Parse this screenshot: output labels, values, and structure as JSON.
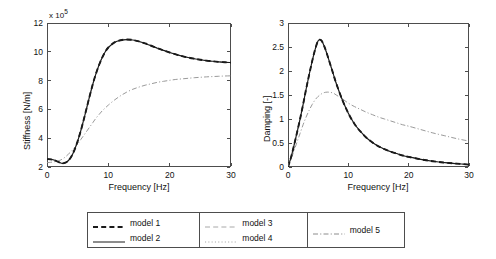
{
  "chart_data": [
    {
      "type": "line",
      "title": "",
      "xlabel": "Frequency [Hz]",
      "ylabel": "Stiffness [N/m]",
      "y_exponent_label": "x 10",
      "y_exponent_value": "5",
      "xlim": [
        0,
        30
      ],
      "ylim": [
        2,
        12
      ],
      "xticks": [
        "0",
        "10",
        "20",
        "30"
      ],
      "yticks": [
        "2",
        "4",
        "6",
        "8",
        "10",
        "12"
      ],
      "grid": false,
      "x": [
        0,
        1,
        2,
        2.5,
        3,
        3.5,
        4,
        4.5,
        5,
        5.5,
        6,
        6.5,
        7,
        7.5,
        8,
        8.5,
        9,
        9.5,
        10,
        11,
        12,
        13,
        14,
        15,
        16,
        17,
        18,
        19,
        20,
        21,
        22,
        23,
        24,
        25,
        26,
        27,
        28,
        29,
        30
      ],
      "series": [
        {
          "name": "model 1",
          "style": "dashed",
          "color": "#1a1a1a",
          "values": [
            2.55,
            2.5,
            2.32,
            2.25,
            2.3,
            2.45,
            2.75,
            3.2,
            3.8,
            4.5,
            5.3,
            6.15,
            7.0,
            7.8,
            8.5,
            9.1,
            9.6,
            10.0,
            10.3,
            10.65,
            10.8,
            10.85,
            10.82,
            10.72,
            10.58,
            10.42,
            10.25,
            10.1,
            9.95,
            9.82,
            9.7,
            9.6,
            9.52,
            9.45,
            9.39,
            9.34,
            9.3,
            9.27,
            9.25
          ]
        },
        {
          "name": "model 2",
          "style": "solid",
          "color": "#1a1a1a",
          "values": [
            2.55,
            2.5,
            2.32,
            2.25,
            2.3,
            2.45,
            2.75,
            3.2,
            3.8,
            4.5,
            5.3,
            6.15,
            7.0,
            7.8,
            8.5,
            9.1,
            9.6,
            10.0,
            10.3,
            10.65,
            10.8,
            10.85,
            10.82,
            10.72,
            10.58,
            10.42,
            10.25,
            10.1,
            9.95,
            9.82,
            9.7,
            9.6,
            9.52,
            9.45,
            9.39,
            9.34,
            9.3,
            9.27,
            9.25
          ]
        },
        {
          "name": "model 3",
          "style": "dashed",
          "color": "#9a9a9a",
          "values": [
            2.55,
            2.5,
            2.32,
            2.25,
            2.3,
            2.45,
            2.75,
            3.2,
            3.8,
            4.5,
            5.3,
            6.15,
            7.0,
            7.8,
            8.5,
            9.1,
            9.6,
            10.0,
            10.3,
            10.65,
            10.8,
            10.85,
            10.82,
            10.72,
            10.58,
            10.42,
            10.25,
            10.1,
            9.95,
            9.82,
            9.7,
            9.6,
            9.52,
            9.45,
            9.39,
            9.34,
            9.3,
            9.27,
            9.25
          ]
        },
        {
          "name": "model 4",
          "style": "dotted",
          "color": "#9a9a9a",
          "values": [
            2.55,
            2.5,
            2.32,
            2.25,
            2.3,
            2.45,
            2.75,
            3.2,
            3.8,
            4.5,
            5.3,
            6.15,
            7.0,
            7.8,
            8.5,
            9.1,
            9.6,
            10.0,
            10.3,
            10.65,
            10.8,
            10.85,
            10.82,
            10.72,
            10.58,
            10.42,
            10.25,
            10.1,
            9.95,
            9.82,
            9.7,
            9.6,
            9.52,
            9.45,
            9.39,
            9.34,
            9.3,
            9.27,
            9.25
          ]
        },
        {
          "name": "model 5",
          "style": "dashdot",
          "color": "#9a9a9a",
          "values": [
            2.3,
            2.35,
            2.45,
            2.55,
            2.7,
            2.9,
            3.1,
            3.35,
            3.6,
            3.9,
            4.2,
            4.5,
            4.8,
            5.1,
            5.4,
            5.65,
            5.9,
            6.1,
            6.3,
            6.65,
            6.95,
            7.2,
            7.4,
            7.55,
            7.68,
            7.78,
            7.88,
            7.95,
            8.02,
            8.08,
            8.12,
            8.16,
            8.2,
            8.23,
            8.26,
            8.28,
            8.3,
            8.32,
            8.33
          ]
        }
      ]
    },
    {
      "type": "line",
      "title": "",
      "xlabel": "Frequency [Hz]",
      "ylabel": "Damping [-]",
      "xlim": [
        0,
        30
      ],
      "ylim": [
        0,
        3
      ],
      "xticks": [
        "0",
        "10",
        "20",
        "30"
      ],
      "yticks": [
        "0",
        "0.5",
        "1",
        "1.5",
        "2",
        "2.5",
        "3"
      ],
      "grid": false,
      "x": [
        0,
        0.5,
        1,
        1.5,
        2,
        2.5,
        3,
        3.5,
        4,
        4.5,
        5,
        5.5,
        6,
        6.5,
        7,
        7.5,
        8,
        9,
        10,
        11,
        12,
        13,
        14,
        15,
        16,
        17,
        18,
        19,
        20,
        22,
        24,
        26,
        28,
        30
      ],
      "series": [
        {
          "name": "model 1",
          "style": "dashed",
          "color": "#1a1a1a",
          "values": [
            0.0,
            0.2,
            0.45,
            0.72,
            1.0,
            1.3,
            1.62,
            1.92,
            2.2,
            2.45,
            2.63,
            2.64,
            2.52,
            2.34,
            2.14,
            1.94,
            1.74,
            1.4,
            1.12,
            0.9,
            0.74,
            0.61,
            0.51,
            0.43,
            0.37,
            0.32,
            0.28,
            0.24,
            0.21,
            0.16,
            0.12,
            0.09,
            0.07,
            0.05
          ]
        },
        {
          "name": "model 2",
          "style": "solid",
          "color": "#1a1a1a",
          "values": [
            0.0,
            0.2,
            0.45,
            0.72,
            1.0,
            1.3,
            1.62,
            1.92,
            2.2,
            2.45,
            2.63,
            2.64,
            2.52,
            2.34,
            2.14,
            1.94,
            1.74,
            1.4,
            1.12,
            0.9,
            0.74,
            0.61,
            0.51,
            0.43,
            0.37,
            0.32,
            0.28,
            0.24,
            0.21,
            0.16,
            0.12,
            0.09,
            0.07,
            0.05
          ]
        },
        {
          "name": "model 3",
          "style": "dashed",
          "color": "#9a9a9a",
          "values": [
            0.0,
            0.2,
            0.45,
            0.72,
            1.0,
            1.3,
            1.62,
            1.92,
            2.2,
            2.45,
            2.63,
            2.64,
            2.52,
            2.34,
            2.14,
            1.94,
            1.74,
            1.4,
            1.12,
            0.9,
            0.74,
            0.61,
            0.51,
            0.43,
            0.37,
            0.32,
            0.28,
            0.24,
            0.21,
            0.16,
            0.12,
            0.09,
            0.07,
            0.05
          ]
        },
        {
          "name": "model 4",
          "style": "dotted",
          "color": "#9a9a9a",
          "values": [
            0.0,
            0.2,
            0.45,
            0.72,
            1.0,
            1.3,
            1.62,
            1.92,
            2.2,
            2.45,
            2.63,
            2.64,
            2.52,
            2.34,
            2.14,
            1.94,
            1.74,
            1.4,
            1.12,
            0.9,
            0.74,
            0.61,
            0.51,
            0.43,
            0.37,
            0.32,
            0.28,
            0.24,
            0.21,
            0.16,
            0.12,
            0.09,
            0.07,
            0.05
          ]
        },
        {
          "name": "model 5",
          "style": "dashdot",
          "color": "#9a9a9a",
          "values": [
            0.0,
            0.16,
            0.34,
            0.52,
            0.7,
            0.88,
            1.04,
            1.18,
            1.3,
            1.4,
            1.47,
            1.52,
            1.55,
            1.56,
            1.555,
            1.54,
            1.5,
            1.42,
            1.33,
            1.26,
            1.2,
            1.14,
            1.09,
            1.04,
            1.0,
            0.96,
            0.92,
            0.88,
            0.85,
            0.78,
            0.71,
            0.65,
            0.59,
            0.54
          ]
        }
      ]
    }
  ],
  "legend": {
    "columns": [
      {
        "entries": [
          {
            "label": "model 1",
            "style": "dashed",
            "color": "#1a1a1a",
            "width": 1.8
          },
          {
            "label": "model 2",
            "style": "solid",
            "color": "#1a1a1a",
            "width": 1.0
          }
        ]
      },
      {
        "entries": [
          {
            "label": "model 3",
            "style": "dashed",
            "color": "#a8a8a8",
            "width": 1.0
          },
          {
            "label": "model 4",
            "style": "dotted",
            "color": "#a8a8a8",
            "width": 1.0
          }
        ]
      },
      {
        "entries": [
          {
            "label": "model 5",
            "style": "dashdot",
            "color": "#8c8c8c",
            "width": 1.0
          }
        ]
      }
    ]
  }
}
